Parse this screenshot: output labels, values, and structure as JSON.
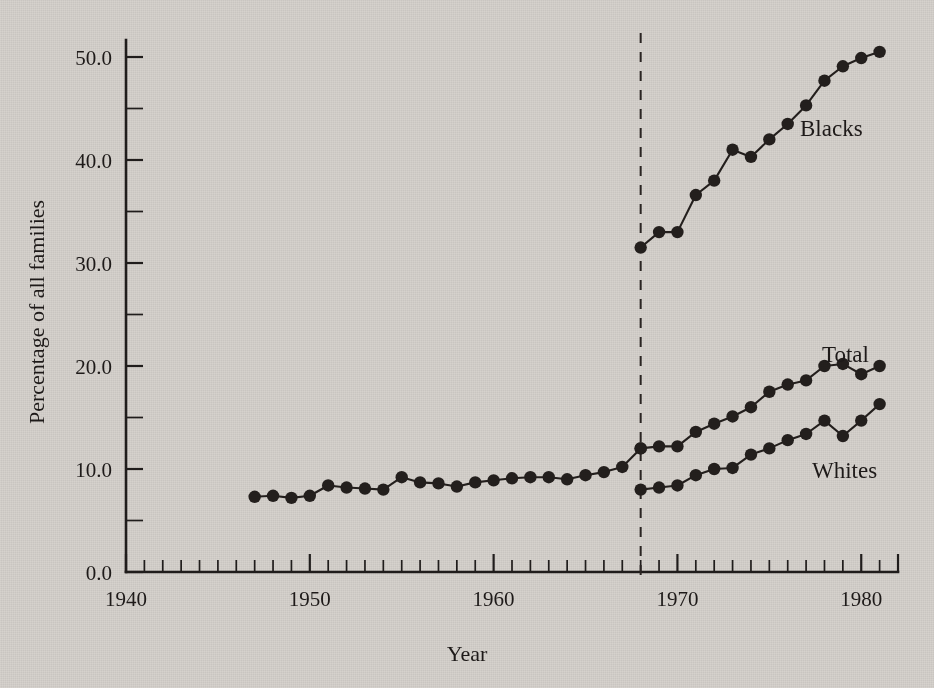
{
  "chart_data": {
    "type": "line",
    "title": "",
    "xlabel": "Year",
    "ylabel": "Percentage of all families",
    "xlim": [
      1940,
      1982
    ],
    "ylim": [
      0.0,
      52.5
    ],
    "grid": false,
    "legend_position": "inline-right",
    "x_ticks_major": [
      1940,
      1950,
      1960,
      1970,
      1980
    ],
    "x_tick_labels": [
      "1940",
      "1950",
      "1960",
      "1970",
      "1980"
    ],
    "x_tick_minor_step": 1,
    "y_ticks_major": [
      0,
      10,
      20,
      30,
      40,
      50
    ],
    "y_tick_labels": [
      "0.0",
      "10.0",
      "20.0",
      "30.0",
      "40.0",
      "50.0"
    ],
    "y_ticks_minor": [
      5,
      15,
      25,
      35,
      45
    ],
    "annotations": [
      {
        "name": "reference-line-1968",
        "type": "vertical-dashed-line",
        "x": 1968,
        "label": ""
      }
    ],
    "series": [
      {
        "name": "Total (pre-1968 combined)",
        "label": "",
        "x": [
          1947,
          1948,
          1949,
          1950,
          1951,
          1952,
          1953,
          1954,
          1955,
          1956,
          1957,
          1958,
          1959,
          1960,
          1961,
          1962,
          1963,
          1964,
          1965,
          1966,
          1967,
          1968
        ],
        "values": [
          7.3,
          7.4,
          7.2,
          7.4,
          8.4,
          8.2,
          8.1,
          8.0,
          9.2,
          8.7,
          8.6,
          8.3,
          8.7,
          8.9,
          9.1,
          9.2,
          9.2,
          9.0,
          9.4,
          9.7,
          10.2,
          12.0
        ]
      },
      {
        "name": "Blacks",
        "label": "Blacks",
        "x": [
          1968,
          1969,
          1970,
          1971,
          1972,
          1973,
          1974,
          1975,
          1976,
          1977,
          1978,
          1979,
          1980,
          1981
        ],
        "values": [
          31.5,
          33.0,
          33.0,
          36.6,
          38.0,
          41.0,
          40.3,
          42.0,
          43.5,
          45.3,
          47.7,
          49.1,
          49.9,
          50.5
        ]
      },
      {
        "name": "Total",
        "label": "Total",
        "x": [
          1968,
          1969,
          1970,
          1971,
          1972,
          1973,
          1974,
          1975,
          1976,
          1977,
          1978,
          1979,
          1980,
          1981
        ],
        "values": [
          12.0,
          12.2,
          12.2,
          13.6,
          14.4,
          15.1,
          16.0,
          17.5,
          18.2,
          18.6,
          20.0,
          20.2,
          19.2,
          20.0
        ]
      },
      {
        "name": "Whites",
        "label": "Whites",
        "x": [
          1968,
          1969,
          1970,
          1971,
          1972,
          1973,
          1974,
          1975,
          1976,
          1977,
          1978,
          1979,
          1980,
          1981
        ],
        "values": [
          8.0,
          8.2,
          8.4,
          9.4,
          10.0,
          10.1,
          11.4,
          12.0,
          12.8,
          13.4,
          14.7,
          13.2,
          14.7,
          16.3
        ]
      }
    ]
  },
  "colors": {
    "background": "#d6d2cd",
    "ink": "#241f1d",
    "axis": "#211d1c"
  },
  "labels": {
    "blacks": "Blacks",
    "total": "Total",
    "whites": "Whites",
    "x_axis_title": "Year",
    "y_axis_title": "Percentage of all families"
  }
}
